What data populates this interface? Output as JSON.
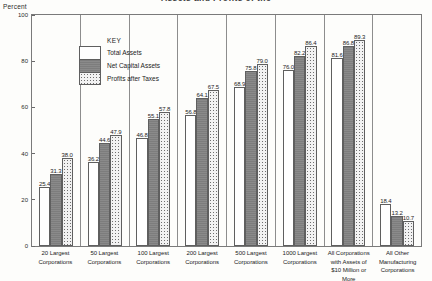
{
  "chart_data": {
    "type": "bar",
    "title": "Assets and Profits of the",
    "ylabel": "Percent",
    "xlabel": "",
    "ylim": [
      0,
      100
    ],
    "yticks": [
      100,
      80,
      60,
      40,
      20,
      0
    ],
    "ytick_labels": [
      "100",
      "80",
      "60",
      "40",
      "20",
      "0"
    ],
    "grid": false,
    "legend_title": "KEY",
    "legend_position": "upper-left-inside",
    "categories": [
      "20 Largest\nCorporations",
      "50 Largest\nCorporations",
      "100 Largest\nCorporations",
      "200 Largest\nCorporations",
      "500 Largest\nCorporations",
      "1000 Largest\nCorporations",
      "All Corporations\nwith Assets of\n$10 Million or More",
      "All Other\nManufacturing\nCorporations"
    ],
    "series": [
      {
        "name": "Total Assets",
        "color": "#ffffff",
        "values": [
          25.4,
          36.2,
          46.8,
          56.8,
          68.9,
          76.0,
          81.6,
          18.4
        ]
      },
      {
        "name": "Net Capital Assets",
        "color": "#7d7d7d",
        "values": [
          31.3,
          44.6,
          55.1,
          64.1,
          75.8,
          82.2,
          86.8,
          13.2
        ]
      },
      {
        "name": "Profits after Taxes",
        "color": "#f2f2f2",
        "values": [
          38.0,
          47.9,
          57.8,
          67.5,
          79.0,
          86.4,
          89.3,
          10.7
        ]
      }
    ]
  },
  "categories_display": [
    [
      "20 Largest",
      "Corporations"
    ],
    [
      "50 Largest",
      "Corporations"
    ],
    [
      "100 Largest",
      "Corporations"
    ],
    [
      "200 Largest",
      "Corporations"
    ],
    [
      "500 Largest",
      "Corporations"
    ],
    [
      "1000 Largest",
      "Corporations"
    ],
    [
      "All Corporations",
      "with Assets of",
      "$10 Million or More"
    ],
    [
      "All Other",
      "Manufacturing",
      "Corporations"
    ]
  ]
}
